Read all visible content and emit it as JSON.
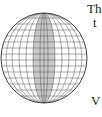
{
  "figure": {
    "shade_color": "#c8c8c8",
    "grid_color": "#555555"
  },
  "text_fragments": [
    "The",
    "t",
    "V"
  ]
}
